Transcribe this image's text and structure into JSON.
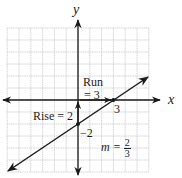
{
  "figure": {
    "axes": {
      "x_label": "x",
      "y_label": "y",
      "x_range": [
        -6,
        6
      ],
      "y_range": [
        -6,
        6
      ],
      "grid": true
    },
    "line": {
      "slope_numerator": 2,
      "slope_denominator": 3,
      "y_intercept": -2,
      "x_intercept": 3
    },
    "annotations": {
      "run_label_line1": "Run",
      "run_label_line2": "= 3",
      "rise_label": "Rise = 2",
      "x_intercept_label": "3",
      "y_intercept_label": "−2",
      "slope_prefix": "m =",
      "slope_num": "2",
      "slope_den": "3"
    },
    "colors": {
      "grid": "#c8c8c8",
      "axis": "#1a1a1a",
      "line": "#1a1a1a"
    }
  }
}
